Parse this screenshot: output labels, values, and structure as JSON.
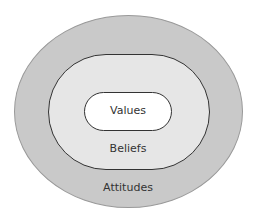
{
  "diagram": {
    "layers": [
      {
        "label": "Values",
        "level": "inner"
      },
      {
        "label": "Beliefs",
        "level": "middle"
      },
      {
        "label": "Attitudes",
        "level": "outer"
      }
    ],
    "colors": {
      "outer": "#c9c9c9",
      "middle": "#e6e6e6",
      "inner": "#ffffff",
      "border": "#333333"
    }
  }
}
